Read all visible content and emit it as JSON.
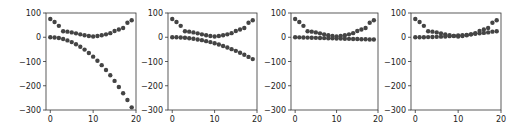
{
  "chart_data": [
    {
      "type": "scatter",
      "title": "",
      "xlabel": "",
      "ylabel": "",
      "xlim": [
        -1,
        20
      ],
      "ylim": [
        -300,
        100
      ],
      "xticks": [
        0,
        10,
        20
      ],
      "yticks": [
        100,
        0,
        -100,
        -200,
        -300
      ],
      "grid": false,
      "legend": null,
      "marker_color": "#444444",
      "x": [
        0,
        1,
        2,
        3,
        4,
        5,
        6,
        7,
        8,
        9,
        10,
        11,
        12,
        13,
        14,
        15,
        16,
        17,
        18,
        19
      ],
      "series": [
        {
          "name": "upper",
          "values": [
            75,
            63,
            47,
            25,
            23,
            20,
            16,
            12,
            8,
            5,
            3,
            5,
            8,
            12,
            17,
            26,
            32,
            38,
            60,
            70
          ]
        },
        {
          "name": "lower",
          "values": [
            0,
            -1,
            -3,
            -7,
            -13,
            -20,
            -29,
            -39,
            -51,
            -65,
            -80,
            -97,
            -115,
            -135,
            -157,
            -180,
            -205,
            -231,
            -259,
            -289
          ]
        }
      ]
    },
    {
      "type": "scatter",
      "title": "",
      "xlabel": "",
      "ylabel": "",
      "xlim": [
        -1,
        20
      ],
      "ylim": [
        -300,
        100
      ],
      "xticks": [
        0,
        10,
        20
      ],
      "yticks": [
        100,
        0,
        -100,
        -200,
        -300
      ],
      "grid": false,
      "legend": null,
      "marker_color": "#444444",
      "x": [
        0,
        1,
        2,
        3,
        4,
        5,
        6,
        7,
        8,
        9,
        10,
        11,
        12,
        13,
        14,
        15,
        16,
        17,
        18,
        19
      ],
      "series": [
        {
          "name": "upper",
          "values": [
            75,
            63,
            47,
            25,
            23,
            20,
            16,
            12,
            8,
            5,
            3,
            5,
            8,
            12,
            17,
            26,
            32,
            38,
            60,
            70
          ]
        },
        {
          "name": "lower",
          "values": [
            0,
            -0.3,
            -1,
            -2,
            -4,
            -6,
            -9,
            -12,
            -16,
            -20,
            -25,
            -30,
            -36,
            -42,
            -49,
            -56,
            -64,
            -72,
            -81,
            -90
          ]
        }
      ]
    },
    {
      "type": "scatter",
      "title": "",
      "xlabel": "",
      "ylabel": "",
      "xlim": [
        -1,
        20
      ],
      "ylim": [
        -300,
        100
      ],
      "xticks": [
        0,
        10,
        20
      ],
      "yticks": [
        100,
        0,
        -100,
        -200,
        -300
      ],
      "grid": false,
      "legend": null,
      "marker_color": "#444444",
      "x": [
        0,
        1,
        2,
        3,
        4,
        5,
        6,
        7,
        8,
        9,
        10,
        11,
        12,
        13,
        14,
        15,
        16,
        17,
        18,
        19
      ],
      "series": [
        {
          "name": "upper",
          "values": [
            75,
            63,
            47,
            25,
            23,
            20,
            16,
            12,
            8,
            5,
            3,
            5,
            8,
            12,
            17,
            26,
            32,
            38,
            60,
            70
          ]
        },
        {
          "name": "lower",
          "values": [
            0,
            -0.5,
            -1,
            -1.5,
            -2,
            -2.5,
            -3,
            -3.5,
            -4,
            -4.5,
            -5,
            -5.5,
            -6,
            -6.5,
            -7,
            -7.5,
            -8,
            -8.5,
            -9,
            -9.5
          ]
        }
      ]
    },
    {
      "type": "scatter",
      "title": "",
      "xlabel": "",
      "ylabel": "",
      "xlim": [
        -1,
        20
      ],
      "ylim": [
        -300,
        100
      ],
      "xticks": [
        0,
        10,
        20
      ],
      "yticks": [
        100,
        0,
        -100,
        -200,
        -300
      ],
      "grid": false,
      "legend": null,
      "marker_color": "#444444",
      "x": [
        0,
        1,
        2,
        3,
        4,
        5,
        6,
        7,
        8,
        9,
        10,
        11,
        12,
        13,
        14,
        15,
        16,
        17,
        18,
        19
      ],
      "series": [
        {
          "name": "upper",
          "values": [
            75,
            63,
            47,
            25,
            23,
            20,
            16,
            12,
            8,
            5,
            3,
            5,
            8,
            12,
            17,
            26,
            32,
            38,
            60,
            70
          ]
        },
        {
          "name": "lower",
          "values": [
            0,
            0.1,
            0.3,
            0.6,
            1.1,
            1.7,
            2.5,
            3.4,
            4.5,
            5.7,
            7,
            8.5,
            10,
            12,
            14,
            16,
            18,
            20,
            23,
            25
          ]
        }
      ]
    }
  ],
  "axes_boxes": [
    {
      "left": 46,
      "right": 136,
      "top": 13,
      "bottom": 110
    },
    {
      "left": 168,
      "right": 257,
      "top": 13,
      "bottom": 110
    },
    {
      "left": 291,
      "right": 378,
      "top": 13,
      "bottom": 110
    },
    {
      "left": 411,
      "right": 501,
      "top": 13,
      "bottom": 110
    }
  ]
}
